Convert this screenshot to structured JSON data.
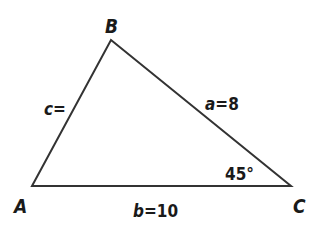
{
  "diagram": {
    "type": "triangle",
    "stroke_color": "#333333",
    "vertices": {
      "A": {
        "label": "A",
        "x": 32,
        "y": 186
      },
      "B": {
        "label": "B",
        "x": 111,
        "y": 40
      },
      "C": {
        "label": "C",
        "x": 291,
        "y": 186
      }
    },
    "sides": {
      "a": {
        "var": "a",
        "eq": "=8"
      },
      "b": {
        "var": "b",
        "eq": "=10"
      },
      "c": {
        "var": "c",
        "eq": "="
      }
    },
    "angle_C": {
      "label": "45°"
    }
  }
}
